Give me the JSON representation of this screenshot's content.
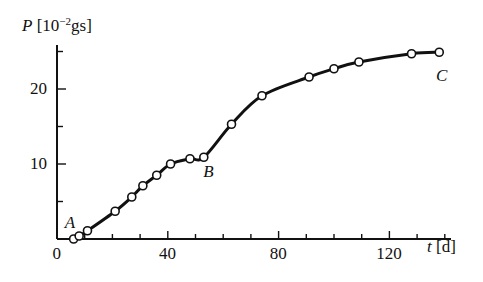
{
  "chart_data": {
    "type": "line",
    "title": "",
    "xlabel": "t [d]",
    "ylabel": "P [10^-2 gs]",
    "ylabel_parts": {
      "var": "P",
      "pre": "[10",
      "exp": "−2",
      "post": "gs]"
    },
    "xlabel_parts": {
      "var": "t",
      "unit": "[d]"
    },
    "xlim": [
      0,
      141
    ],
    "ylim": [
      0,
      26
    ],
    "xticks_major": [
      0,
      40,
      80,
      120
    ],
    "xticks_minor": [
      10,
      20,
      30,
      50,
      60,
      70,
      90,
      100,
      110,
      130,
      140
    ],
    "yticks_major": [
      10,
      20
    ],
    "yticks_minor": [
      5,
      15,
      25
    ],
    "x_tick_labels": [
      "0",
      "40",
      "80",
      "120"
    ],
    "y_tick_labels": [
      "10",
      "20"
    ],
    "grid": false,
    "legend": null,
    "series": [
      {
        "name": "P(t)",
        "marker": "open-circle",
        "x": [
          6,
          8,
          11,
          21,
          27,
          31,
          36,
          41,
          48,
          53,
          63,
          74,
          91,
          100,
          109,
          128,
          138
        ],
        "y": [
          0.0,
          0.4,
          1.1,
          3.7,
          5.6,
          7.1,
          8.5,
          10.0,
          10.7,
          10.9,
          15.3,
          19.1,
          21.6,
          22.7,
          23.6,
          24.7,
          24.9
        ]
      }
    ],
    "annotations": [
      {
        "text": "A",
        "x": 5,
        "y": 2.2
      },
      {
        "text": "B",
        "x": 55,
        "y": 8.9
      },
      {
        "text": "C",
        "x": 139,
        "y": 21.8
      }
    ]
  },
  "labels": {
    "origin": "0"
  }
}
